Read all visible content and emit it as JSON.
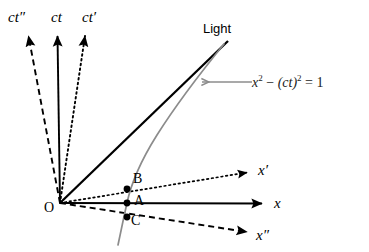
{
  "figure": {
    "width": 369,
    "height": 252,
    "background": "#ffffff"
  },
  "colors": {
    "line": "#000000",
    "hyperbola": "#8c8c8c",
    "annotation_arrow": "#8c8c8c",
    "text": "#000000",
    "equation_text": "#1a1a1a"
  },
  "origin": {
    "label": "O",
    "x": 60,
    "y": 203
  },
  "time_axes": [
    {
      "name": "ct-double-prime-axis",
      "label_base": "ct",
      "label_prime": "″",
      "style": "dashed",
      "tip_x": 28,
      "tip_y": 30,
      "label_x": 8,
      "label_y": 10
    },
    {
      "name": "ct-axis",
      "label_base": "ct",
      "label_prime": "",
      "style": "solid",
      "tip_x": 57,
      "tip_y": 30,
      "label_x": 51,
      "label_y": 10
    },
    {
      "name": "ct-prime-axis",
      "label_base": "ct",
      "label_prime": "′",
      "style": "dotted",
      "tip_x": 85,
      "tip_y": 30,
      "label_x": 82,
      "label_y": 10
    }
  ],
  "space_axes": [
    {
      "name": "x-prime-axis",
      "label_base": "x",
      "label_prime": "′",
      "style": "dotted",
      "tip_x": 253,
      "tip_y": 172,
      "label_x": 258,
      "label_y": 163
    },
    {
      "name": "x-axis",
      "label_base": "x",
      "label_prime": "",
      "style": "solid",
      "tip_x": 268,
      "tip_y": 204,
      "label_x": 274,
      "label_y": 196
    },
    {
      "name": "x-double-prime-axis",
      "label_base": "x",
      "label_prime": "″",
      "style": "dashed",
      "tip_x": 253,
      "tip_y": 232,
      "label_x": 256,
      "label_y": 228
    }
  ],
  "light_line": {
    "name": "light-worldline",
    "label": "Light",
    "style": "solid",
    "from_x": 60,
    "from_y": 203,
    "to_x": 227,
    "to_y": 42,
    "label_x": 203,
    "label_y": 22
  },
  "hyperbola": {
    "name": "invariant-hyperbola",
    "equation_plain": "x^2 - (ct)^2 = 1",
    "equation_parts": {
      "x": "x",
      "x_exp": "2",
      "minus": "−",
      "ct": "(ct)",
      "ct_exp": "2",
      "equals": "=",
      "value": "1"
    },
    "vertex_x": 127,
    "vertex_y": 203,
    "color": "#8c8c8c",
    "label_x": 252,
    "label_y": 74
  },
  "annotation_arrow": {
    "name": "equation-pointer-arrow",
    "from_x": 252,
    "from_y": 82,
    "to_x": 199,
    "to_y": 82,
    "color": "#8c8c8c"
  },
  "event_points": [
    {
      "name": "point-B",
      "label": "B",
      "x": 127,
      "y": 189,
      "on_axis": "x-prime-axis",
      "label_x": 133,
      "label_y": 175
    },
    {
      "name": "point-A",
      "label": "A",
      "x": 127,
      "y": 203,
      "on_axis": "x-axis",
      "label_x": 134,
      "label_y": 196
    },
    {
      "name": "point-C",
      "label": "C",
      "x": 127,
      "y": 217,
      "on_axis": "x-double-prime-axis",
      "label_x": 131,
      "label_y": 216
    }
  ]
}
